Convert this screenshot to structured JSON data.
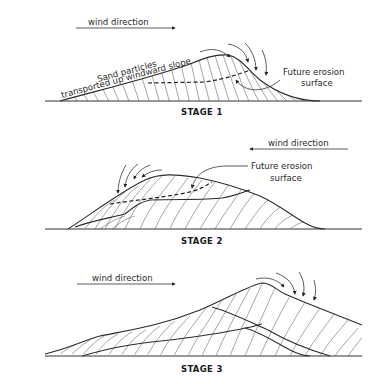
{
  "figure": {
    "stages": [
      {
        "label": "STAGE 1",
        "wind_label": "wind direction",
        "wind_arrow": "right",
        "annotations": [
          "Sand particles",
          "transported up windward slope",
          "Future erosion",
          "surface"
        ]
      },
      {
        "label": "STAGE 2",
        "wind_label": "wind direction",
        "wind_arrow": "left",
        "annotations": [
          "Future erosion",
          "surface"
        ]
      },
      {
        "label": "STAGE 3",
        "wind_label": "wind direction",
        "wind_arrow": "right",
        "annotations": []
      }
    ]
  }
}
